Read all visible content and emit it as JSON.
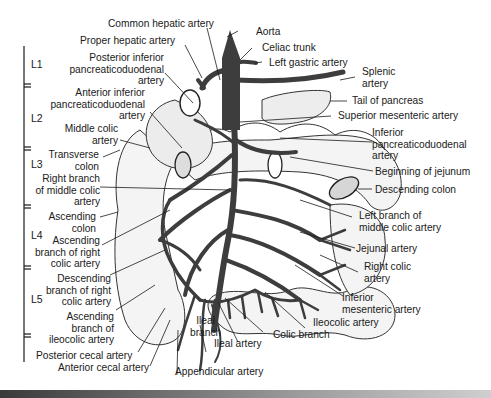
{
  "figure": {
    "vertebral_levels": [
      "L1",
      "L2",
      "L3",
      "L4",
      "L5"
    ],
    "labels_top": {
      "common_hepatic": "Common hepatic artery",
      "proper_hepatic": "Proper hepatic artery",
      "aorta": "Aorta",
      "celiac_trunk": "Celiac trunk",
      "left_gastric": "Left gastric artery"
    },
    "labels_left": {
      "post_inf_panc": [
        "Posterior inferior",
        "pancreaticoduodenal",
        "artery"
      ],
      "ant_inf_panc": [
        "Anterior inferior",
        "pancreaticoduodenal",
        "artery"
      ],
      "middle_colic": [
        "Middle colic",
        "artery"
      ],
      "transverse_colon": [
        "Transverse",
        "colon"
      ],
      "right_branch_mc": [
        "Right branch",
        "of middle colic",
        "artery"
      ],
      "ascending_colon": [
        "Ascending",
        "colon"
      ],
      "asc_branch_rc": [
        "Ascending",
        "branch of right",
        "colic artery"
      ],
      "desc_branch_rc": [
        "Descending",
        "branch of right",
        "colic artery"
      ],
      "asc_branch_ic": [
        "Ascending",
        "branch of",
        "ileocolic artery"
      ],
      "posterior_cecal": "Posterior cecal artery",
      "anterior_cecal": "Anterior cecal artery"
    },
    "labels_right": {
      "splenic": [
        "Splenic",
        "artery"
      ],
      "tail_pancreas": "Tail of pancreas",
      "sma": "Superior mesenteric artery",
      "inf_panc": [
        "Inferior",
        "pancreaticoduodenal",
        "artery"
      ],
      "jejunum": "Beginning of jejunum",
      "desc_colon": "Descending colon",
      "left_branch_mc": [
        "Left branch of",
        "middle colic artery"
      ],
      "jejunal": "Jejunal artery",
      "right_colic": [
        "Right colic",
        "artery"
      ],
      "ima": [
        "Inferior",
        "mesenteric artery"
      ],
      "ileocolic": "Ileocolic artery"
    },
    "labels_bottom": {
      "ileal_branch": [
        "Ileal",
        "branch"
      ],
      "ileal_artery": "Ileal artery",
      "colic_branch": "Colic branch",
      "appendicular": "Appendicular artery"
    }
  },
  "colors": {
    "artery_fill": "#3d3d3d",
    "line": "#1a1a1a",
    "organ_fill": "#f2f2f2",
    "background": "#ffffff"
  }
}
